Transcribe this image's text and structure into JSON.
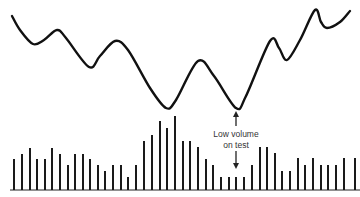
{
  "chart_data": {
    "type": "line+bar",
    "title": "",
    "xlabel": "",
    "ylabel": "",
    "grid": false,
    "legend": null,
    "price_line": {
      "description": "Price curve with double bottom; second low tested on low volume",
      "points": [
        [
          12,
          16
        ],
        [
          20,
          30
        ],
        [
          33,
          44
        ],
        [
          44,
          40
        ],
        [
          57,
          30
        ],
        [
          66,
          38
        ],
        [
          89,
          67
        ],
        [
          100,
          56
        ],
        [
          115,
          41
        ],
        [
          128,
          50
        ],
        [
          150,
          88
        ],
        [
          166,
          108
        ],
        [
          176,
          100
        ],
        [
          198,
          61
        ],
        [
          214,
          76
        ],
        [
          236,
          108
        ],
        [
          246,
          96
        ],
        [
          270,
          41
        ],
        [
          279,
          48
        ],
        [
          287,
          60
        ],
        [
          300,
          40
        ],
        [
          315,
          10
        ],
        [
          321,
          22
        ],
        [
          327,
          28
        ],
        [
          340,
          22
        ],
        [
          350,
          11
        ]
      ]
    },
    "volume_bars": {
      "baseline_y": 189,
      "x": [
        14,
        22,
        30,
        37,
        45,
        52,
        60,
        68,
        75,
        83,
        90,
        98,
        105,
        113,
        121,
        128,
        136,
        144,
        152,
        160,
        167,
        175,
        183,
        190,
        198,
        206,
        213,
        221,
        229,
        236,
        244,
        252,
        260,
        267,
        275,
        282,
        290,
        298,
        305,
        313,
        321,
        328,
        336,
        344,
        355
      ],
      "top_y": [
        159,
        154,
        148,
        159,
        159,
        148,
        154,
        165,
        154,
        154,
        159,
        165,
        171,
        165,
        165,
        177,
        165,
        141,
        135,
        121,
        128,
        116,
        141,
        141,
        147,
        159,
        165,
        177,
        177,
        177,
        177,
        165,
        147,
        147,
        153,
        171,
        171,
        158,
        165,
        158,
        165,
        165,
        165,
        158,
        158
      ]
    },
    "annotations": [
      {
        "text_line1": "Low volume",
        "text_line2": "on test",
        "x": 236,
        "y": 137
      }
    ]
  },
  "labels": {
    "annotation_line1": "Low volume",
    "annotation_line2": "on test"
  }
}
